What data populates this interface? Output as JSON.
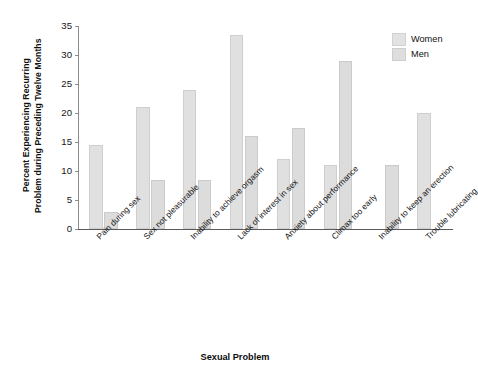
{
  "chart_data": {
    "type": "bar",
    "title": "",
    "xlabel": "Sexual Problem",
    "ylabel": "Percent Experiencing Recurring Problem during Preceding Twelve Months",
    "ylabel_line1": "Percent Experiencing Recurring",
    "ylabel_line2": "Problem during Preceding Twelve Months",
    "ylim": [
      0,
      35
    ],
    "yticks": [
      0,
      5,
      10,
      15,
      20,
      25,
      30,
      35
    ],
    "grid": false,
    "legend_position": "top-right",
    "categories": [
      "Pain during sex",
      "Sex not pleasurable",
      "Inability to achieve orgasm",
      "Lack of interest in sex",
      "Anxiety about performance",
      "Climax too early",
      "Inability to keep an erection",
      "Trouble lubricating"
    ],
    "series": [
      {
        "name": "Women",
        "color": "#e0e0e0",
        "values": [
          14.5,
          21.0,
          24.0,
          33.5,
          12.0,
          11.0,
          null,
          20.0
        ]
      },
      {
        "name": "Men",
        "color": "#dcdcdc",
        "values": [
          3.0,
          8.5,
          8.5,
          16.0,
          17.5,
          29.0,
          11.0,
          null
        ]
      }
    ]
  },
  "legend": {
    "items": [
      {
        "label": "Women"
      },
      {
        "label": "Men"
      }
    ]
  },
  "axis": {
    "x_title": "Sexual Problem",
    "y_title_line1": "Percent Experiencing Recurring",
    "y_title_line2": "Problem during Preceding Twelve Months"
  }
}
